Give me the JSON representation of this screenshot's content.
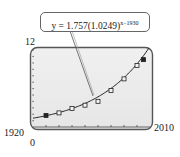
{
  "chart_data": {
    "type": "scatter",
    "title": "",
    "equation": {
      "prefix": "y = 1.757(1.0249)",
      "exponent": "x−1930",
      "full": "y = 1.757(1.0249)^(x−1930)"
    },
    "xlabel": "",
    "ylabel": "",
    "xlim": [
      1920,
      2010
    ],
    "ylim": [
      0,
      12
    ],
    "window_labels": {
      "xmin": "1920",
      "xmax": "2010",
      "ymin": "0",
      "ymax": "12"
    },
    "x_tick_step": 10,
    "y_tick_step": 1,
    "grid": false,
    "legend": null,
    "series": [
      {
        "name": "data",
        "marker": "square",
        "x": [
          1930,
          1940,
          1950,
          1960,
          1970,
          1980,
          1990,
          2000,
          2005
        ],
        "y": [
          1.8,
          2.2,
          2.9,
          3.4,
          4.0,
          5.7,
          7.5,
          9.6,
          10.5
        ]
      },
      {
        "name": "model",
        "type": "line",
        "formula": "1.757*1.0249^(x-1930)"
      }
    ]
  },
  "colors": {
    "screen_bg": "#ececec",
    "frame": "#555555",
    "curve": "#222222",
    "marker": "#222222"
  }
}
